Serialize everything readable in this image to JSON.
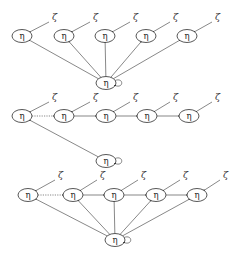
{
  "node_label": "η",
  "input_label": "ζ",
  "colors": {
    "stroke": "#444444",
    "edge": "#555555",
    "background": "#ffffff"
  },
  "diagrams": [
    {
      "name": "hub-to-all",
      "description": "Shared hub η with self-loop connects to five independent η nodes, each driven by ζ",
      "chain_nodes": [
        [
          22,
          36
        ],
        [
          64,
          36
        ],
        [
          105,
          36
        ],
        [
          146,
          36
        ],
        [
          187,
          36
        ]
      ],
      "zetas": [
        [
          52,
          20
        ],
        [
          93,
          20
        ],
        [
          133,
          20
        ],
        [
          173,
          20
        ],
        [
          215,
          20
        ]
      ],
      "hub": [
        106,
        83
      ],
      "chain_edges": [],
      "hub_targets": [
        0,
        1,
        2,
        3,
        4
      ]
    },
    {
      "name": "chain-hub-first",
      "description": "Chain of five η nodes (first link dotted), hub η with self-loop feeds only the first",
      "chain_nodes": [
        [
          22,
          116
        ],
        [
          64,
          116
        ],
        [
          106,
          116
        ],
        [
          147,
          116
        ],
        [
          189,
          116
        ]
      ],
      "zetas": [
        [
          52,
          100
        ],
        [
          93,
          100
        ],
        [
          133,
          100
        ],
        [
          173,
          100
        ],
        [
          215,
          100
        ]
      ],
      "hub": [
        106,
        161
      ],
      "chain_edges": [
        [
          0,
          1,
          "dotted"
        ],
        [
          1,
          2,
          "solid"
        ],
        [
          2,
          3,
          "solid"
        ],
        [
          3,
          4,
          "solid"
        ]
      ],
      "hub_targets": [
        0
      ]
    },
    {
      "name": "chain-hub-all",
      "description": "Chain of five η nodes (first link dotted), hub η with self-loop feeds all",
      "chain_nodes": [
        [
          28,
          195
        ],
        [
          73,
          195
        ],
        [
          114,
          195
        ],
        [
          156,
          195
        ],
        [
          197,
          195
        ]
      ],
      "zetas": [
        [
          58,
          178
        ],
        [
          100,
          178
        ],
        [
          141,
          178
        ],
        [
          183,
          178
        ],
        [
          223,
          178
        ]
      ],
      "hub": [
        115,
        240
      ],
      "chain_edges": [
        [
          0,
          1,
          "dotted"
        ],
        [
          1,
          2,
          "solid"
        ],
        [
          2,
          3,
          "solid"
        ],
        [
          3,
          4,
          "solid"
        ]
      ],
      "hub_targets": [
        0,
        1,
        2,
        3,
        4
      ]
    }
  ]
}
